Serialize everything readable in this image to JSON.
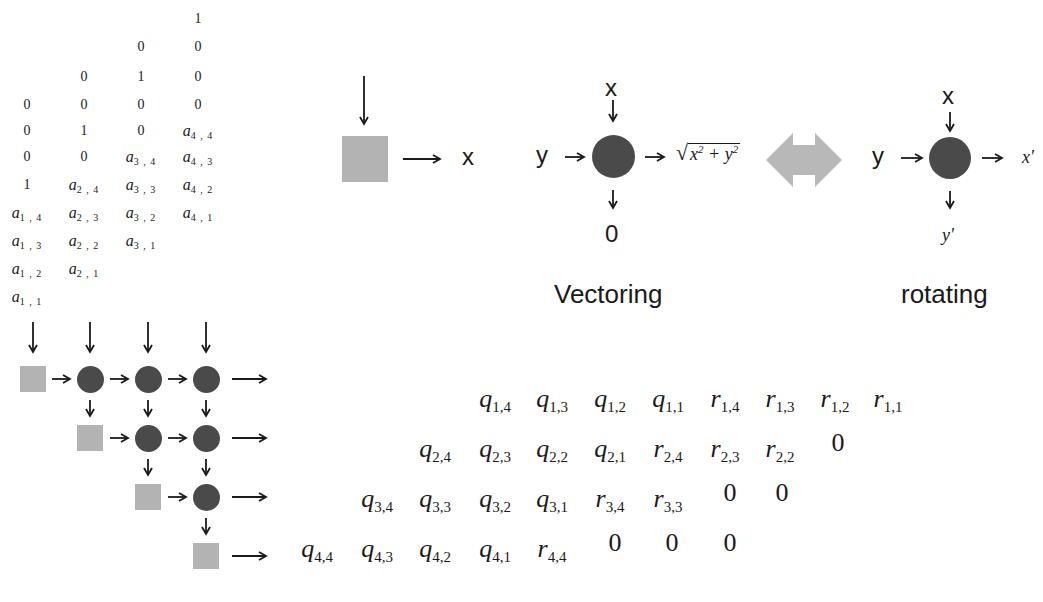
{
  "input_matrix": {
    "columns": [
      {
        "x": 27,
        "items": [
          {
            "y": 100,
            "v": "0"
          },
          {
            "y": 126,
            "v": "0"
          },
          {
            "y": 152,
            "v": "0"
          },
          {
            "y": 180,
            "v": "1"
          },
          {
            "y": 208,
            "v": "a",
            "s": "1,4"
          },
          {
            "y": 236,
            "v": "a",
            "s": "1,3"
          },
          {
            "y": 264,
            "v": "a",
            "s": "1,2"
          },
          {
            "y": 292,
            "v": "a",
            "s": "1,1"
          }
        ]
      },
      {
        "x": 84,
        "items": [
          {
            "y": 72,
            "v": "0"
          },
          {
            "y": 100,
            "v": "0"
          },
          {
            "y": 126,
            "v": "1"
          },
          {
            "y": 152,
            "v": "0"
          },
          {
            "y": 180,
            "v": "a",
            "s": "2,4"
          },
          {
            "y": 208,
            "v": "a",
            "s": "2,3"
          },
          {
            "y": 236,
            "v": "a",
            "s": "2,2"
          },
          {
            "y": 264,
            "v": "a",
            "s": "2,1"
          }
        ]
      },
      {
        "x": 141,
        "items": [
          {
            "y": 42,
            "v": "0"
          },
          {
            "y": 72,
            "v": "1"
          },
          {
            "y": 100,
            "v": "0"
          },
          {
            "y": 126,
            "v": "0"
          },
          {
            "y": 152,
            "v": "a",
            "s": "3,4"
          },
          {
            "y": 180,
            "v": "a",
            "s": "3,3"
          },
          {
            "y": 208,
            "v": "a",
            "s": "3,2"
          },
          {
            "y": 236,
            "v": "a",
            "s": "3,1"
          }
        ]
      },
      {
        "x": 198,
        "items": [
          {
            "y": 14,
            "v": "1"
          },
          {
            "y": 42,
            "v": "0"
          },
          {
            "y": 72,
            "v": "0"
          },
          {
            "y": 100,
            "v": "0"
          },
          {
            "y": 126,
            "v": "a",
            "s": "4,4"
          },
          {
            "y": 152,
            "v": "a",
            "s": "4,3"
          },
          {
            "y": 180,
            "v": "a",
            "s": "4,2"
          },
          {
            "y": 208,
            "v": "a",
            "s": "4,1"
          }
        ]
      }
    ]
  },
  "legend": {
    "boundary_output": "x",
    "vectoring": {
      "in_top": "x",
      "in_left": "y",
      "out_right": "√(x² + y²)",
      "out_bottom": "0",
      "label": "Vectoring"
    },
    "rotating": {
      "in_top": "x",
      "in_left": "y",
      "out_right": "x'",
      "out_bottom": "y'",
      "label": "rotating"
    }
  },
  "output_matrix": {
    "rows": [
      {
        "y": 390,
        "items": [
          {
            "x": 475,
            "v": "q",
            "s": "1,4"
          },
          {
            "x": 532,
            "v": "q",
            "s": "1,3"
          },
          {
            "x": 590,
            "v": "q",
            "s": "1,2"
          },
          {
            "x": 648,
            "v": "q",
            "s": "1,1"
          },
          {
            "x": 705,
            "v": "r",
            "s": "1,4"
          },
          {
            "x": 760,
            "v": "r",
            "s": "1,3"
          },
          {
            "x": 815,
            "v": "r",
            "s": "1,2"
          },
          {
            "x": 868,
            "v": "r",
            "s": "1,1"
          }
        ]
      },
      {
        "y": 440,
        "items": [
          {
            "x": 415,
            "v": "q",
            "s": "2,4"
          },
          {
            "x": 475,
            "v": "q",
            "s": "2,3"
          },
          {
            "x": 532,
            "v": "q",
            "s": "2,2"
          },
          {
            "x": 590,
            "v": "q",
            "s": "2,1"
          },
          {
            "x": 648,
            "v": "r",
            "s": "2,4"
          },
          {
            "x": 705,
            "v": "r",
            "s": "2,3"
          },
          {
            "x": 760,
            "v": "r",
            "s": "2,2"
          },
          {
            "x": 818,
            "v": "0"
          }
        ]
      },
      {
        "y": 490,
        "items": [
          {
            "x": 357,
            "v": "q",
            "s": "3,4"
          },
          {
            "x": 415,
            "v": "q",
            "s": "3,3"
          },
          {
            "x": 475,
            "v": "q",
            "s": "3,2"
          },
          {
            "x": 532,
            "v": "q",
            "s": "3,1"
          },
          {
            "x": 590,
            "v": "r",
            "s": "3,4"
          },
          {
            "x": 648,
            "v": "r",
            "s": "3,3"
          },
          {
            "x": 710,
            "v": "0"
          },
          {
            "x": 762,
            "v": "0"
          }
        ]
      },
      {
        "y": 540,
        "items": [
          {
            "x": 297,
            "v": "q",
            "s": "4,4"
          },
          {
            "x": 357,
            "v": "q",
            "s": "4,3"
          },
          {
            "x": 415,
            "v": "q",
            "s": "4,2"
          },
          {
            "x": 475,
            "v": "q",
            "s": "4,1"
          },
          {
            "x": 532,
            "v": "r",
            "s": "4,4"
          },
          {
            "x": 595,
            "v": "0"
          },
          {
            "x": 652,
            "v": "0"
          },
          {
            "x": 710,
            "v": "0"
          }
        ]
      }
    ]
  },
  "colors": {
    "boundary_cell": "#b3b3b3",
    "internal_cell": "#4a4a4a",
    "swap_arrow": "#b8b8b8"
  }
}
